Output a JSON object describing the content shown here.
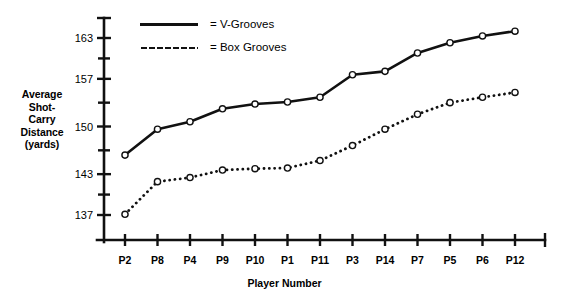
{
  "chart_data": {
    "type": "line",
    "title": "",
    "xlabel": "Player Number",
    "ylabel": "Average Shot-Carry Distance (yards)",
    "ylabel_lines": [
      "Average",
      "Shot-",
      "Carry",
      "Distance",
      "(yards)"
    ],
    "categories": [
      "P2",
      "P8",
      "P4",
      "P9",
      "P10",
      "P1",
      "P11",
      "P3",
      "P14",
      "P7",
      "P5",
      "P6",
      "P12"
    ],
    "ylim": [
      134,
      166
    ],
    "ytick_labels": [
      "137",
      "143",
      "150",
      "157",
      "163"
    ],
    "ytick_values": [
      137,
      143,
      150,
      157,
      163
    ],
    "yminor_values": [
      140,
      146.5,
      153.5,
      160
    ],
    "grid": false,
    "legend_position": "top-left-inside",
    "series": [
      {
        "name": "V-Grooves",
        "legend_label": "= V-Grooves",
        "style": "solid",
        "marker": "open-circle",
        "color": "#111111",
        "values": [
          145.8,
          149.6,
          150.7,
          152.6,
          153.3,
          153.6,
          154.3,
          157.6,
          158.1,
          160.8,
          162.3,
          163.3,
          164.0
        ]
      },
      {
        "name": "Box Grooves",
        "legend_label": "= Box Grooves",
        "style": "dotted",
        "marker": "open-circle",
        "color": "#111111",
        "values": [
          137.1,
          141.9,
          142.5,
          143.6,
          143.8,
          143.9,
          145.0,
          147.2,
          149.6,
          151.8,
          153.5,
          154.3,
          155.0
        ]
      }
    ]
  }
}
